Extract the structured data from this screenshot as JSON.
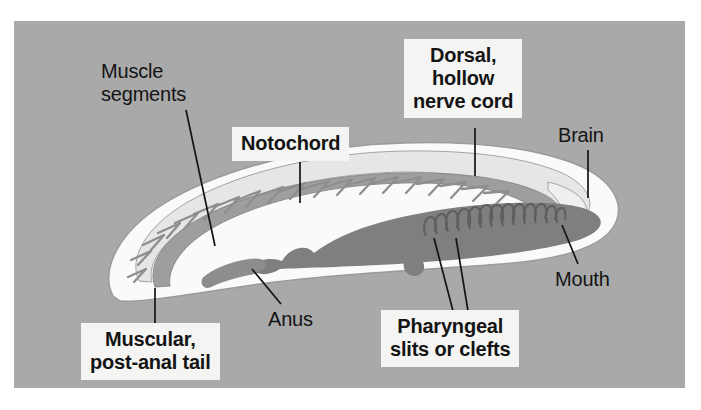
{
  "figure": {
    "panel_background_color": "#a9a9a9",
    "page_background_color": "#ffffff",
    "text_color": "#141414",
    "label_box_color": "#f4f4f2"
  },
  "labels": [
    {
      "id": "muscle-segments",
      "text": "Muscle\nsegments",
      "style": "plain",
      "align": "left",
      "x": 101,
      "y": 60,
      "leader": {
        "x1": 186,
        "y1": 110,
        "x2": 215,
        "y2": 246
      }
    },
    {
      "id": "notochord",
      "text": "Notochord",
      "style": "boxed",
      "align": "center",
      "x": 232,
      "y": 127,
      "leader": {
        "x1": 300,
        "y1": 162,
        "x2": 300,
        "y2": 203
      }
    },
    {
      "id": "dorsal-hollow-nerve-cord",
      "text": "Dorsal,\nhollow\nnerve cord",
      "style": "boxed",
      "align": "center",
      "x": 404,
      "y": 39,
      "leader": {
        "x1": 475,
        "y1": 128,
        "x2": 475,
        "y2": 175
      }
    },
    {
      "id": "brain",
      "text": "Brain",
      "style": "plain",
      "align": "left",
      "x": 558,
      "y": 124,
      "leader": {
        "x1": 588,
        "y1": 150,
        "x2": 588,
        "y2": 196
      }
    },
    {
      "id": "mouth",
      "text": "Mouth",
      "style": "plain",
      "align": "left",
      "x": 555,
      "y": 268,
      "leader": {
        "x1": 578,
        "y1": 264,
        "x2": 563,
        "y2": 226
      }
    },
    {
      "id": "anus",
      "text": "Anus",
      "style": "plain",
      "align": "left",
      "x": 268,
      "y": 308,
      "leader": {
        "x1": 280,
        "y1": 303,
        "x2": 253,
        "y2": 270
      }
    },
    {
      "id": "muscular-post-anal-tail",
      "text": "Muscular,\npost-anal tail",
      "style": "boxed",
      "align": "center",
      "x": 81,
      "y": 323,
      "leader": {
        "x1": 155,
        "y1": 287,
        "x2": 155,
        "y2": 324
      }
    },
    {
      "id": "pharyngeal-slits-or-clefts",
      "text": "Pharyngeal\nslits or clefts",
      "style": "boxed",
      "align": "center",
      "x": 381,
      "y": 310,
      "leader_multi": [
        {
          "x1": 453,
          "y1": 310,
          "x2": 434,
          "y2": 237
        },
        {
          "x1": 467,
          "y1": 310,
          "x2": 455,
          "y2": 237
        }
      ]
    }
  ],
  "anatomy": {
    "body_fill": "#fafaf8",
    "notochord_fill": "#9b9b9b",
    "nerve_cord_fill": "#e4e4e2",
    "pharynx_fill": "#7e7e7e",
    "gut_fill": "#8a8a8a",
    "outline": "#8a8a8a",
    "myomere_stroke": "#8c8c8c",
    "myomere_count": 19,
    "pharyngeal_slit_count": 13
  }
}
